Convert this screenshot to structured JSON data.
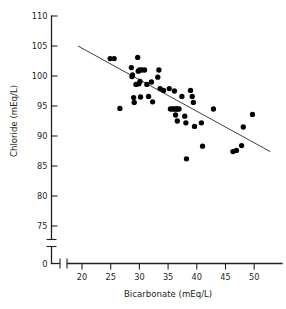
{
  "chart_data": {
    "type": "scatter",
    "title": "",
    "xlabel": "Bicarbonate (mEq/L)",
    "ylabel": "Chloride (mEq/L)",
    "xlim": [
      17.5,
      53.5
    ],
    "ylim": [
      73.0,
      110.0
    ],
    "x_ticks": [
      20,
      25,
      30,
      35,
      40,
      45,
      50
    ],
    "y_ticks": [
      75,
      80,
      85,
      90,
      95,
      100,
      105,
      110
    ],
    "y_origin_tick": 0,
    "axis_break_x": true,
    "axis_break_y": true,
    "grid": false,
    "legend": "none",
    "point_color": "#000000",
    "line_color": "#3f3f3f",
    "points": [
      {
        "x": 24.9,
        "y": 102.9
      },
      {
        "x": 25.6,
        "y": 102.9
      },
      {
        "x": 26.6,
        "y": 94.6
      },
      {
        "x": 28.6,
        "y": 101.4
      },
      {
        "x": 28.7,
        "y": 99.9
      },
      {
        "x": 28.8,
        "y": 100.2
      },
      {
        "x": 29.0,
        "y": 96.4
      },
      {
        "x": 29.1,
        "y": 95.6
      },
      {
        "x": 29.4,
        "y": 98.6
      },
      {
        "x": 29.7,
        "y": 103.1
      },
      {
        "x": 29.8,
        "y": 100.8
      },
      {
        "x": 29.9,
        "y": 98.7
      },
      {
        "x": 30.0,
        "y": 101.0
      },
      {
        "x": 30.1,
        "y": 99.1
      },
      {
        "x": 30.2,
        "y": 96.5
      },
      {
        "x": 30.4,
        "y": 101.0
      },
      {
        "x": 30.9,
        "y": 101.0
      },
      {
        "x": 31.3,
        "y": 98.6
      },
      {
        "x": 31.6,
        "y": 96.6
      },
      {
        "x": 32.1,
        "y": 99.0
      },
      {
        "x": 32.3,
        "y": 95.7
      },
      {
        "x": 33.2,
        "y": 99.8
      },
      {
        "x": 33.4,
        "y": 101.0
      },
      {
        "x": 33.6,
        "y": 97.9
      },
      {
        "x": 34.2,
        "y": 97.6
      },
      {
        "x": 35.2,
        "y": 97.9
      },
      {
        "x": 35.4,
        "y": 94.5
      },
      {
        "x": 35.8,
        "y": 94.5
      },
      {
        "x": 36.1,
        "y": 94.5
      },
      {
        "x": 36.4,
        "y": 94.5
      },
      {
        "x": 36.6,
        "y": 94.5
      },
      {
        "x": 36.9,
        "y": 94.5
      },
      {
        "x": 36.1,
        "y": 97.5
      },
      {
        "x": 36.3,
        "y": 93.5
      },
      {
        "x": 36.6,
        "y": 92.5
      },
      {
        "x": 37.4,
        "y": 96.6
      },
      {
        "x": 37.9,
        "y": 93.3
      },
      {
        "x": 38.1,
        "y": 92.2
      },
      {
        "x": 38.2,
        "y": 86.2
      },
      {
        "x": 38.9,
        "y": 97.6
      },
      {
        "x": 39.2,
        "y": 96.6
      },
      {
        "x": 39.4,
        "y": 95.6
      },
      {
        "x": 39.6,
        "y": 91.6
      },
      {
        "x": 40.8,
        "y": 92.2
      },
      {
        "x": 41.0,
        "y": 88.3
      },
      {
        "x": 42.9,
        "y": 94.5
      },
      {
        "x": 46.3,
        "y": 87.4
      },
      {
        "x": 46.9,
        "y": 87.6
      },
      {
        "x": 47.8,
        "y": 88.4
      },
      {
        "x": 48.1,
        "y": 91.5
      },
      {
        "x": 49.7,
        "y": 93.6
      }
    ],
    "fit_line": {
      "x_start": 19.3,
      "y_start": 105.0,
      "x_end": 52.8,
      "y_end": 87.4
    }
  }
}
